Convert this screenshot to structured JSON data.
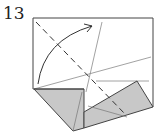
{
  "diagram": {
    "type": "origami-fold-step",
    "step_number": "13",
    "colors": {
      "line": "#555555",
      "thin_line": "#8a8a8a",
      "paper_white": "#ffffff",
      "paper_gray": "#c8c8c8",
      "arrow": "#333333"
    },
    "elements": [
      {
        "name": "square-outline",
        "desc": "paper square with open top-left flap"
      },
      {
        "name": "valley-fold-dashed-diagonal",
        "desc": "dashed fold line from top-left corner to lower right"
      },
      {
        "name": "fold-arrow",
        "desc": "curved arrow from left edge up toward top"
      },
      {
        "name": "left-gray-flap",
        "desc": "folded gray triangle bottom left"
      },
      {
        "name": "right-gray-flap",
        "desc": "folded gray quadrilateral bottom right"
      },
      {
        "name": "crease-lines",
        "desc": "thin crease reference lines"
      }
    ]
  }
}
